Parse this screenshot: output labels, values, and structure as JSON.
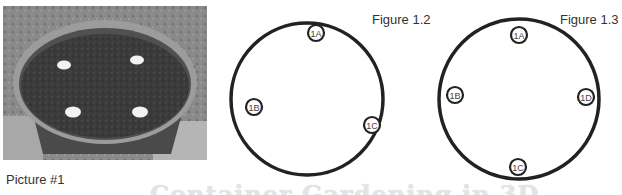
{
  "photo": {
    "caption": "Picture #1",
    "subject": "grayscale photo of a round plastic pot filled with soil and four white markers on the surface"
  },
  "figures": [
    {
      "id": "figure-1-2",
      "label": "Figure 1.2",
      "markers": [
        {
          "id": "1A",
          "label": "1A"
        },
        {
          "id": "1B",
          "label": "1B"
        },
        {
          "id": "1C",
          "label": "1C"
        }
      ]
    },
    {
      "id": "figure-1-3",
      "label": "Figure 1.3",
      "markers": [
        {
          "id": "1A",
          "label": "1A"
        },
        {
          "id": "1B",
          "label": "1B"
        },
        {
          "id": "1D",
          "label": "1D"
        },
        {
          "id": "1C",
          "label": "1C"
        }
      ]
    }
  ],
  "watermark": "Container Gardening in 3D",
  "colors": {
    "line": "#222222",
    "text": "#333333",
    "watermark": "#e4e4e4"
  }
}
